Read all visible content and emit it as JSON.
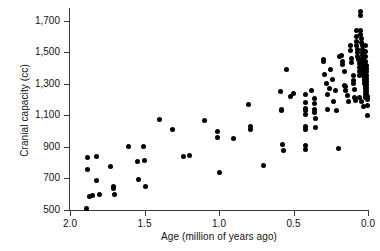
{
  "chart_data": {
    "type": "scatter",
    "title": "",
    "xlabel": "Age (million of years ago)",
    "ylabel": "Cranial capacity (cc)",
    "xlim": [
      2.0,
      0.0
    ],
    "ylim": [
      500,
      1780
    ],
    "x_reversed": true,
    "grid": false,
    "legend": null,
    "xticks": [
      2.0,
      1.5,
      1.0,
      0.5,
      0.0
    ],
    "xtick_labels": [
      "2.0",
      "1.5",
      "1.0",
      "0.5",
      "0.0"
    ],
    "yticks": [
      500,
      700,
      900,
      1100,
      1300,
      1500,
      1700
    ],
    "ytick_labels": [
      "500",
      "700",
      "900",
      "1,100",
      "1,300",
      "1,500",
      "1,700"
    ],
    "marker": "filled-circle",
    "marker_color": "#000000",
    "points": [
      [
        1.89,
        508
      ],
      [
        1.88,
        830
      ],
      [
        1.88,
        755
      ],
      [
        1.87,
        587
      ],
      [
        1.85,
        592
      ],
      [
        1.82,
        686
      ],
      [
        1.82,
        840
      ],
      [
        1.8,
        596
      ],
      [
        1.73,
        775
      ],
      [
        1.71,
        650
      ],
      [
        1.71,
        637
      ],
      [
        1.7,
        601
      ],
      [
        1.61,
        905
      ],
      [
        1.55,
        805
      ],
      [
        1.54,
        694
      ],
      [
        1.51,
        900
      ],
      [
        1.5,
        812
      ],
      [
        1.49,
        648
      ],
      [
        1.4,
        1075
      ],
      [
        1.31,
        1010
      ],
      [
        1.24,
        840
      ],
      [
        1.2,
        848
      ],
      [
        1.1,
        1068
      ],
      [
        1.01,
        1000
      ],
      [
        1.01,
        962
      ],
      [
        1.0,
        735
      ],
      [
        0.9,
        955
      ],
      [
        0.8,
        1170
      ],
      [
        0.79,
        1030
      ],
      [
        0.79,
        1010
      ],
      [
        0.7,
        780
      ],
      [
        0.59,
        1250
      ],
      [
        0.58,
        1140
      ],
      [
        0.58,
        1128
      ],
      [
        0.575,
        915
      ],
      [
        0.57,
        875
      ],
      [
        0.55,
        1390
      ],
      [
        0.52,
        1218
      ],
      [
        0.5,
        1238
      ],
      [
        0.42,
        1230
      ],
      [
        0.42,
        1180
      ],
      [
        0.42,
        1145
      ],
      [
        0.42,
        1128
      ],
      [
        0.42,
        1105
      ],
      [
        0.42,
        1028
      ],
      [
        0.42,
        1012
      ],
      [
        0.42,
        910
      ],
      [
        0.42,
        882
      ],
      [
        0.38,
        1255
      ],
      [
        0.36,
        1205
      ],
      [
        0.36,
        1175
      ],
      [
        0.36,
        1135
      ],
      [
        0.36,
        1120
      ],
      [
        0.35,
        1082
      ],
      [
        0.35,
        1022
      ],
      [
        0.3,
        1455
      ],
      [
        0.3,
        1440
      ],
      [
        0.29,
        1360
      ],
      [
        0.28,
        1300
      ],
      [
        0.27,
        1230
      ],
      [
        0.27,
        1140
      ],
      [
        0.26,
        1268
      ],
      [
        0.25,
        1390
      ],
      [
        0.24,
        1330
      ],
      [
        0.23,
        1190
      ],
      [
        0.22,
        1258
      ],
      [
        0.21,
        1128
      ],
      [
        0.2,
        890
      ],
      [
        0.19,
        1470
      ],
      [
        0.18,
        1480
      ],
      [
        0.17,
        1440
      ],
      [
        0.17,
        1425
      ],
      [
        0.16,
        1375
      ],
      [
        0.16,
        1290
      ],
      [
        0.15,
        1285
      ],
      [
        0.15,
        1255
      ],
      [
        0.14,
        1225
      ],
      [
        0.13,
        1190
      ],
      [
        0.12,
        1540
      ],
      [
        0.12,
        1510
      ],
      [
        0.11,
        1460
      ],
      [
        0.11,
        1435
      ],
      [
        0.1,
        1355
      ],
      [
        0.1,
        1320
      ],
      [
        0.1,
        1300
      ],
      [
        0.09,
        1265
      ],
      [
        0.09,
        1215
      ],
      [
        0.085,
        1195
      ],
      [
        0.08,
        1640
      ],
      [
        0.08,
        1600
      ],
      [
        0.08,
        1565
      ],
      [
        0.075,
        1545
      ],
      [
        0.07,
        1520
      ],
      [
        0.07,
        1495
      ],
      [
        0.07,
        1470
      ],
      [
        0.065,
        1452
      ],
      [
        0.06,
        1430
      ],
      [
        0.06,
        1400
      ],
      [
        0.06,
        1375
      ],
      [
        0.055,
        1350
      ],
      [
        0.05,
        1755
      ],
      [
        0.05,
        1730
      ],
      [
        0.05,
        1640
      ],
      [
        0.05,
        1615
      ],
      [
        0.045,
        1585
      ],
      [
        0.045,
        1560
      ],
      [
        0.04,
        1540
      ],
      [
        0.04,
        1520
      ],
      [
        0.04,
        1500
      ],
      [
        0.04,
        1480
      ],
      [
        0.035,
        1462
      ],
      [
        0.035,
        1445
      ],
      [
        0.03,
        1428
      ],
      [
        0.03,
        1408
      ],
      [
        0.03,
        1390
      ],
      [
        0.03,
        1370
      ],
      [
        0.028,
        1352
      ],
      [
        0.025,
        1335
      ],
      [
        0.025,
        1318
      ],
      [
        0.022,
        1300
      ],
      [
        0.02,
        1285
      ],
      [
        0.02,
        1268
      ],
      [
        0.02,
        1250
      ],
      [
        0.02,
        1232
      ],
      [
        0.018,
        1215
      ],
      [
        0.015,
        1540
      ],
      [
        0.015,
        1505
      ],
      [
        0.015,
        1470
      ],
      [
        0.015,
        1440
      ],
      [
        0.012,
        1415
      ],
      [
        0.012,
        1395
      ],
      [
        0.012,
        1375
      ],
      [
        0.01,
        1355
      ],
      [
        0.01,
        1335
      ],
      [
        0.01,
        1315
      ],
      [
        0.01,
        1295
      ],
      [
        0.01,
        1275
      ],
      [
        0.008,
        1258
      ],
      [
        0.008,
        1240
      ],
      [
        0.005,
        1222
      ],
      [
        0.005,
        1200
      ],
      [
        0.005,
        1160
      ],
      [
        0.005,
        1098
      ],
      [
        0.03,
        1155
      ],
      [
        0.06,
        1210
      ],
      [
        0.045,
        1185
      ]
    ]
  }
}
